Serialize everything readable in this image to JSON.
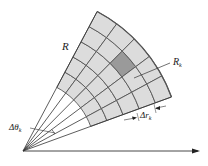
{
  "diagram": {
    "origin": [
      23,
      151
    ],
    "inner_radius": 72,
    "outer_radius": 158,
    "theta_start_deg": 20,
    "theta_end_deg": 62,
    "radial_divisions": 5,
    "angular_divisions": 5,
    "highlighted_cell": {
      "ring": 3,
      "sector": 2
    },
    "colors": {
      "cell_fill": "#dcdcdc",
      "highlight_fill": "#9a9a9a",
      "grid_stroke": "#555555",
      "line": "#333333"
    }
  },
  "labels": {
    "region": "R",
    "cell": "R",
    "cell_sub": "k",
    "delta_theta": "Δθ",
    "delta_theta_sub": "k",
    "delta_r": "Δr",
    "delta_r_sub": "k"
  }
}
